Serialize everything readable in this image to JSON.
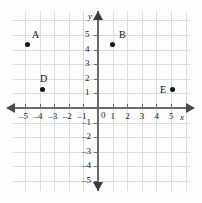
{
  "figure": {
    "kind": "coordinate-plane",
    "x_axis_label": "x",
    "y_axis_label": "y",
    "origin_label": "0"
  },
  "chart_data": {
    "type": "scatter",
    "title": "",
    "xlabel": "x",
    "ylabel": "y",
    "xlim": [
      -5,
      5
    ],
    "ylim": [
      -5,
      5
    ],
    "grid": true,
    "legend": "none",
    "x_ticks": [
      "–5",
      "–4",
      "–3",
      "–2",
      "–1",
      "1",
      "2",
      "3",
      "4",
      "5"
    ],
    "y_ticks": [
      "5",
      "4",
      "3",
      "2",
      "1",
      "–1",
      "–2",
      "–3",
      "–4",
      "–5"
    ],
    "points": [
      {
        "label": "A",
        "x": -5,
        "y": 4,
        "label_pos": "upper-right"
      },
      {
        "label": "B",
        "x": 1,
        "y": 4,
        "label_pos": "upper-right"
      },
      {
        "label": "D",
        "x": -4,
        "y": 1,
        "label_pos": "above"
      },
      {
        "label": "E",
        "x": 5,
        "y": 1,
        "label_pos": "left"
      }
    ],
    "colors": {
      "point": "#111111",
      "grid": "#dcdcdc",
      "axis": "#6b6b6b",
      "background": "#fdfdfd"
    }
  },
  "ticks": {
    "x_neg": [
      "–5",
      "–4",
      "–3",
      "–2",
      "–1"
    ],
    "x_pos": [
      "1",
      "2",
      "3",
      "4",
      "5"
    ],
    "y_pos": [
      "5",
      "4",
      "3",
      "2",
      "1"
    ],
    "y_neg": [
      "–1",
      "–2",
      "–3",
      "–4",
      "–5"
    ]
  },
  "points": {
    "a": {
      "label": "A"
    },
    "b": {
      "label": "B"
    },
    "d": {
      "label": "D"
    },
    "e": {
      "label": "E"
    }
  }
}
